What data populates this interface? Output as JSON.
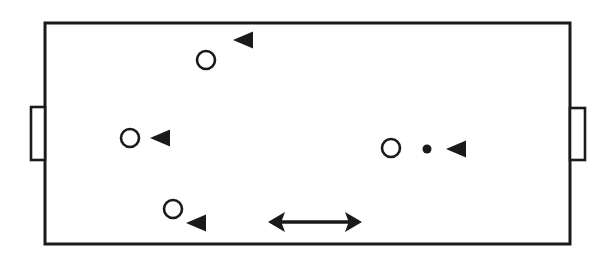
{
  "diagram": {
    "type": "sports-field-positions",
    "canvas": {
      "width": 604,
      "height": 255,
      "background": "#ffffff"
    },
    "colors": {
      "stroke": "#1a1a1a",
      "fill": "#ffffff"
    },
    "field": {
      "label": "playing-field",
      "x": 45,
      "y": 23,
      "width": 525,
      "height": 221,
      "stroke_width": 3
    },
    "goals": [
      {
        "label": "left-goal",
        "side": "left",
        "x": 31,
        "y": 107,
        "width": 14,
        "height": 53
      },
      {
        "label": "right-goal",
        "side": "right",
        "x": 570,
        "y": 108,
        "width": 15,
        "height": 52
      }
    ],
    "players": [
      {
        "label": "player-1",
        "shape": "open-circle",
        "cx": 206,
        "cy": 60,
        "r": 9
      },
      {
        "label": "player-2",
        "shape": "open-circle",
        "cx": 130,
        "cy": 138,
        "r": 9
      },
      {
        "label": "player-3",
        "shape": "open-circle",
        "cx": 173,
        "cy": 209,
        "r": 9
      },
      {
        "label": "player-4",
        "shape": "open-circle",
        "cx": 391,
        "cy": 148,
        "r": 9
      }
    ],
    "direction_markers": [
      {
        "label": "marker-1",
        "shape": "triangle-left",
        "cx": 243,
        "cy": 40,
        "w": 20,
        "h": 17
      },
      {
        "label": "marker-2",
        "shape": "triangle-left",
        "cx": 160,
        "cy": 138,
        "w": 20,
        "h": 17
      },
      {
        "label": "marker-3",
        "shape": "triangle-left",
        "cx": 196,
        "cy": 223,
        "w": 20,
        "h": 17
      },
      {
        "label": "marker-4",
        "shape": "triangle-left",
        "cx": 456,
        "cy": 149,
        "w": 20,
        "h": 17
      }
    ],
    "ball": {
      "label": "ball",
      "shape": "filled-dot",
      "cx": 427,
      "cy": 149,
      "r": 4.5
    },
    "measure_arrow": {
      "label": "double-headed-arrow",
      "x1": 268,
      "x2": 362,
      "y": 222,
      "head_length": 14,
      "head_half_height": 10
    }
  }
}
